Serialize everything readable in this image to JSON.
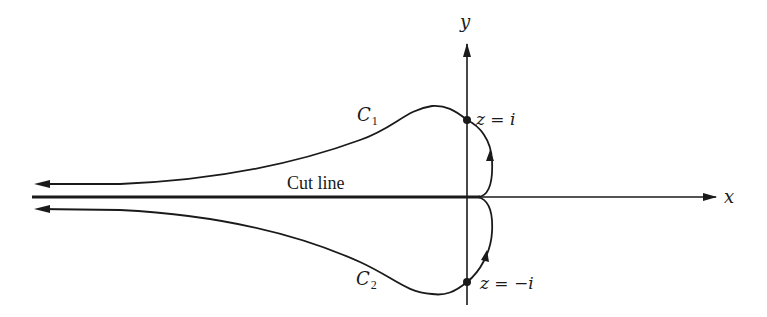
{
  "figure": {
    "axes": {
      "x_label": "x",
      "y_label": "y"
    },
    "cut_line_label": "Cut line",
    "contours": [
      {
        "name": "C",
        "subscript": "1",
        "point_label": "z = i"
      },
      {
        "name": "C",
        "subscript": "2",
        "point_label": "z = −i"
      }
    ],
    "colors": {
      "ink": "#1a1a1a",
      "background": "#ffffff"
    }
  }
}
